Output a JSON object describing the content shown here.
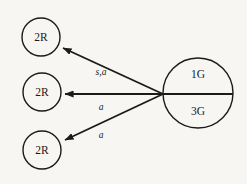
{
  "diagram": {
    "type": "directed-graph",
    "background_color": "#f7f6f3",
    "stroke_color": "#1b1b1b",
    "source_node": {
      "id": "source",
      "shape": "circle",
      "cx": 198,
      "cy": 93,
      "r": 35,
      "divided": true,
      "top_label": "1G",
      "bottom_label": "3G"
    },
    "target_nodes": [
      {
        "id": "target-top",
        "shape": "circle",
        "cx": 41,
        "cy": 37,
        "r": 19,
        "label": "2R"
      },
      {
        "id": "target-middle",
        "shape": "circle",
        "cx": 42,
        "cy": 92,
        "r": 19,
        "label": "2R"
      },
      {
        "id": "target-bottom",
        "shape": "circle",
        "cx": 42,
        "cy": 150,
        "r": 19,
        "label": "2R"
      }
    ],
    "edges": [
      {
        "id": "edge-top",
        "from": "source",
        "to": "target-top",
        "label": "s,a",
        "label_x": 101,
        "label_y": 73,
        "x1": 163,
        "y1": 94,
        "x2": 60,
        "y2": 46
      },
      {
        "id": "edge-middle",
        "from": "source",
        "to": "target-middle",
        "label": "a",
        "label_x": 101,
        "label_y": 108,
        "x1": 163,
        "y1": 94,
        "x2": 62,
        "y2": 94
      },
      {
        "id": "edge-bottom",
        "from": "source",
        "to": "target-bottom",
        "label": "a",
        "label_x": 101,
        "label_y": 136,
        "x1": 163,
        "y1": 94,
        "x2": 62,
        "y2": 142
      }
    ]
  }
}
